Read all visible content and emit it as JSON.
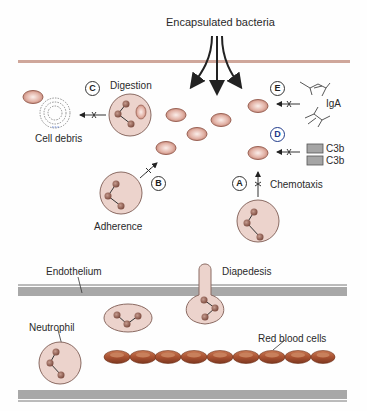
{
  "title": "Encapsulated bacteria",
  "labels": {
    "digestion": "Digestion",
    "cell_debris": "Cell debris",
    "iga": "IgA",
    "c3b_1": "C3b",
    "c3b_2": "C3b",
    "chemotaxis": "Chemotaxis",
    "adherence": "Adherence",
    "endothelium": "Endothelium",
    "diapedesis": "Diapedesis",
    "neutrophil": "Neutrophil",
    "red_blood_cells": "Red blood cells"
  },
  "steps": {
    "a": "A",
    "b": "B",
    "c": "C",
    "d": "D",
    "e": "E"
  },
  "colors": {
    "tissue_line": "#c9a59a",
    "vessel_wall": "#a9a9a9",
    "cell_fill": "#f0d9d2",
    "nucleus": "#9a6b5e",
    "rbc": "#b5603a",
    "bacterium": "#e7bfb5",
    "step_d": "#1f3a8a"
  }
}
